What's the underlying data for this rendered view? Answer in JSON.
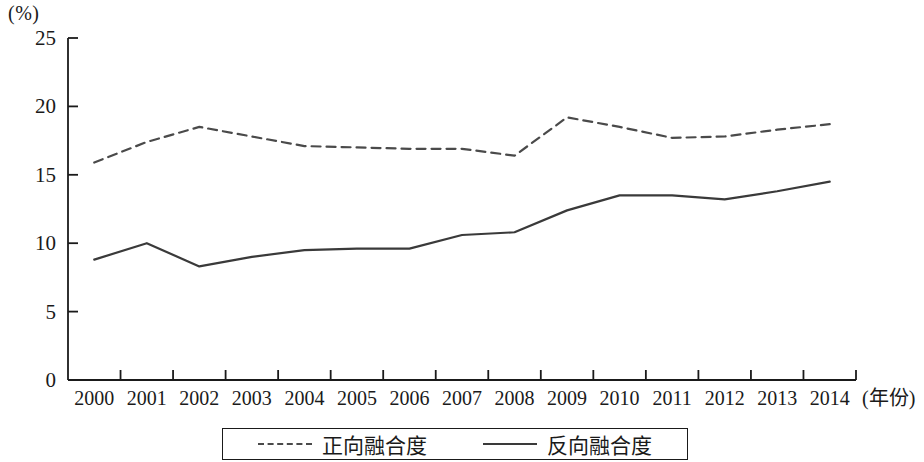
{
  "chart_data": {
    "type": "line",
    "title": "",
    "xlabel": "(年份)",
    "ylabel": "(%)",
    "categories": [
      "2000",
      "2001",
      "2002",
      "2003",
      "2004",
      "2005",
      "2006",
      "2007",
      "2008",
      "2009",
      "2010",
      "2011",
      "2012",
      "2013",
      "2014"
    ],
    "x": [
      2000,
      2001,
      2002,
      2003,
      2004,
      2005,
      2006,
      2007,
      2008,
      2009,
      2010,
      2011,
      2012,
      2013,
      2014
    ],
    "series": [
      {
        "name": "正向融合度",
        "style": "dashed",
        "color": "#4a4a4a",
        "values": [
          15.9,
          17.4,
          18.5,
          17.8,
          17.1,
          17.0,
          16.9,
          16.9,
          16.4,
          19.2,
          18.5,
          17.7,
          17.8,
          18.3,
          18.7
        ]
      },
      {
        "name": "反向融合度",
        "style": "solid",
        "color": "#3a3a3a",
        "values": [
          8.8,
          10.0,
          8.3,
          9.0,
          9.5,
          9.6,
          9.6,
          10.6,
          10.8,
          12.4,
          13.5,
          13.5,
          13.2,
          13.8,
          14.5
        ]
      }
    ],
    "ylim": [
      0,
      25
    ],
    "yticks": [
      0,
      5,
      10,
      15,
      20,
      25
    ],
    "ytick_labels": [
      "0",
      "5",
      "10",
      "15",
      "20",
      "25"
    ],
    "grid": false,
    "legend_position": "bottom-center"
  },
  "axes": {
    "unit_label": "(%)",
    "year_label": "(年份)"
  },
  "legend": {
    "entries": [
      {
        "label": "正向融合度",
        "style": "dashed"
      },
      {
        "label": "反向融合度",
        "style": "solid"
      }
    ]
  }
}
